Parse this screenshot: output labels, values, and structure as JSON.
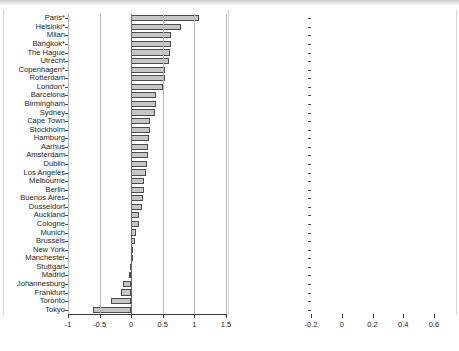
{
  "figure": {
    "title": "",
    "panel_count": 2,
    "bar_fill": "#c6c6c6",
    "bar_stroke": "#4c4c4c",
    "axis_color": "#3a3a3a",
    "grid_color": "#b8b8b8"
  },
  "chart_data": [
    {
      "type": "bar",
      "orientation": "horizontal",
      "panel": "left",
      "title": "",
      "xlabel": "",
      "ylabel": "",
      "xlim": [
        -1,
        1.5
      ],
      "xticks": [
        -1,
        -0.5,
        0,
        0.5,
        1,
        1.5
      ],
      "xticklabels": [
        "-1",
        "-0.5",
        "0",
        "0.5",
        "1",
        "1.5"
      ],
      "grid": true,
      "legend": "none",
      "categories": [
        "Paris*",
        "Helsinki*",
        "Milan",
        "Bangkok*",
        "The Hague",
        "Utrecht",
        "Copenhagen*",
        "Rotterdam",
        "London*",
        "Barcelona",
        "Birmingham",
        "Sydney",
        "Cape Town",
        "Stockholm",
        "Hamburg",
        "Aarhus",
        "Amsterdam",
        "Dublin",
        "Los Angeles",
        "Melbourne",
        "Berlin",
        "Buenos Aires",
        "Dusseldorf",
        "Auckland",
        "Cologne",
        "Munich",
        "Brussels",
        "New York",
        "Manchester",
        "Stuttgart",
        "Madrid",
        "Johannesburg",
        "Frankfurt",
        "Toronto",
        "Tokyo"
      ],
      "values": [
        1.08,
        0.79,
        0.63,
        0.63,
        0.62,
        0.6,
        0.54,
        0.54,
        0.51,
        0.4,
        0.39,
        0.38,
        0.3,
        0.29,
        0.28,
        0.27,
        0.27,
        0.25,
        0.23,
        0.21,
        0.21,
        0.19,
        0.17,
        0.13,
        0.13,
        0.08,
        0.06,
        0.03,
        0.01,
        -0.02,
        -0.04,
        -0.13,
        -0.16,
        -0.32,
        -0.61
      ]
    },
    {
      "type": "bar",
      "orientation": "horizontal",
      "panel": "right",
      "title": "",
      "xlabel": "",
      "ylabel": "",
      "xlim": [
        -0.2,
        0.6
      ],
      "xticks": [
        -0.2,
        0,
        0.2,
        0.4,
        0.6
      ],
      "xticklabels": [
        "-0.2",
        "0",
        "0.2",
        "0.4",
        "0.6"
      ],
      "grid": true,
      "legend": "none",
      "categories": [
        "Johannesburg*",
        "Cape Town*",
        "New York*",
        "Los Angeles*",
        "Paris*",
        "Helsinki*",
        "Milan",
        "Copenhagen*",
        "Amsterdam*",
        "Auckland*",
        "Buenos Aires*",
        "Brussels",
        "Dublin",
        "London*",
        "Berlin*",
        "Stockholm",
        "Tokyo",
        "Birmingham",
        "Madrid*",
        "Toronto",
        "Barcelona",
        "Bangkok",
        "Aarhus",
        "Frankfurt",
        "Manchester",
        "Utrecht",
        "Munich",
        "Dusseldorf",
        "Cologne",
        "Sydney",
        "The Hague",
        "Stuttgart",
        "Rotterdam",
        "Hamburg",
        "Melbourne"
      ],
      "values": [
        0.525,
        0.5,
        0.48,
        0.455,
        0.45,
        0.44,
        0.425,
        0.37,
        0.305,
        0.3,
        0.29,
        0.265,
        0.255,
        0.25,
        0.245,
        0.23,
        0.2,
        0.185,
        0.175,
        0.16,
        0.155,
        0.15,
        0.14,
        0.125,
        0.075,
        0.06,
        0.06,
        0.055,
        0.05,
        0.04,
        0.01,
        -0.005,
        -0.02,
        -0.045,
        -0.12
      ]
    }
  ]
}
